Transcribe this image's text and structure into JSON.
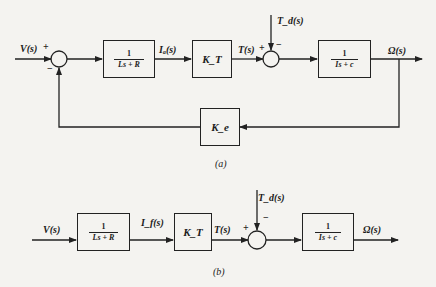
{
  "diagram_a": {
    "caption": "(a)",
    "input_label": "V(s)",
    "sum1_plus": "+",
    "sum1_minus": "−",
    "block_electrical": {
      "numerator": "1",
      "denominator": "Ls + R"
    },
    "current_label": "Iₐ(s)",
    "block_torque_gain": "K_T",
    "torque_label": "T(s)",
    "sum2_plus": "+",
    "sum2_minus": "−",
    "disturbance_label": "T_d(s)",
    "block_mechanical": {
      "numerator": "1",
      "denominator": "Is + c"
    },
    "output_label": "Ω(s)",
    "block_feedback_gain": "K_e"
  },
  "diagram_b": {
    "caption": "(b)",
    "input_label": "V(s)",
    "block_electrical": {
      "numerator": "1",
      "denominator": "Ls + R"
    },
    "current_label": "I_f(s)",
    "block_torque_gain": "K_T",
    "torque_label": "T(s)",
    "sum_plus": "+",
    "sum_minus": "−",
    "disturbance_label": "T_d(s)",
    "block_mechanical": {
      "numerator": "1",
      "denominator": "Is + c"
    },
    "output_label": "Ω(s)"
  }
}
